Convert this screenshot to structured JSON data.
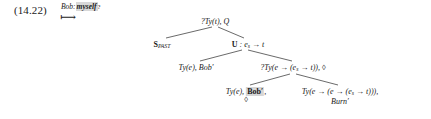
{
  "figure": {
    "example_number": "(14.22)",
    "gloss": {
      "speaker": "Bob:",
      "highlighted_word": "myself",
      "question_mark": "?",
      "mapsto_symbol": "⟼"
    },
    "tree": {
      "root": {
        "label": "?Ty(t), Q",
        "type_prefix": "?Ty(",
        "type_arg": "t",
        "type_suffix": "), Q"
      },
      "level2_left": {
        "label": "S_PAST",
        "main": "S",
        "subscript": "PAST"
      },
      "level2_right": {
        "label": "U : e_s → t",
        "main": "U",
        "colon": " : ",
        "arg": "e",
        "arg_sub": "s",
        "arrow": " → ",
        "result": "t"
      },
      "level3_left": {
        "label": "Ty(e), Bob′",
        "type": "Ty(e),",
        "formula": "Bob′"
      },
      "level3_right": {
        "label": "?Ty(e → (e_s → t)), ◊",
        "prefix": "?Ty(e → (e",
        "sub": "s",
        "suffix": " → t)),",
        "diamond": "◊"
      },
      "level4_left": {
        "type": "Ty(e),",
        "formula_highlighted": "Bob′",
        "comma": ",",
        "diamond": "◊"
      },
      "level4_right": {
        "prefix": "Ty(e → (e → (e",
        "sub": "s",
        "suffix": " → t))),",
        "formula": "Burn′"
      }
    },
    "colors": {
      "text": "#1a1a1a",
      "highlight": "#d6d6d6",
      "line": "#2a2a2a",
      "background": "#ffffff"
    }
  }
}
